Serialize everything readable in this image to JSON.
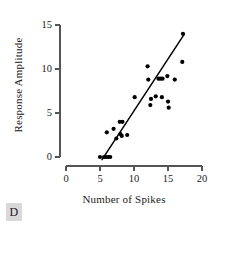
{
  "panel": {
    "letter": "D"
  },
  "chart_data": {
    "type": "scatter",
    "title": "",
    "xlabel": "Number of Spikes",
    "ylabel": "Response Amplitude",
    "xlim": [
      0,
      20
    ],
    "ylim": [
      0,
      15
    ],
    "xticks": [
      0,
      5,
      10,
      15,
      20
    ],
    "yticks": [
      0,
      5,
      10,
      15
    ],
    "xtick_labels": [
      "0",
      "5",
      "10",
      "15",
      "20"
    ],
    "ytick_labels": [
      "0",
      "5",
      "10",
      "15"
    ],
    "grid": false,
    "legend": null,
    "marker_color": "#000000",
    "marker_size": 4.2,
    "line_color": "#000000",
    "points": [
      [
        5.0,
        0.0
      ],
      [
        5.6,
        0.0
      ],
      [
        5.9,
        0.0
      ],
      [
        6.2,
        0.0
      ],
      [
        6.5,
        0.0
      ],
      [
        6.0,
        2.8
      ],
      [
        7.0,
        3.2
      ],
      [
        7.4,
        2.1
      ],
      [
        7.9,
        4.0
      ],
      [
        8.3,
        4.0
      ],
      [
        8.0,
        2.6
      ],
      [
        8.2,
        2.4
      ],
      [
        9.0,
        2.5
      ],
      [
        10.1,
        6.8
      ],
      [
        12.0,
        10.3
      ],
      [
        12.1,
        8.8
      ],
      [
        12.5,
        6.6
      ],
      [
        12.4,
        5.9
      ],
      [
        13.2,
        6.9
      ],
      [
        13.6,
        8.9
      ],
      [
        13.9,
        8.9
      ],
      [
        14.2,
        8.9
      ],
      [
        14.1,
        6.8
      ],
      [
        14.9,
        9.2
      ],
      [
        15.0,
        6.3
      ],
      [
        15.1,
        5.6
      ],
      [
        16.0,
        8.8
      ],
      [
        17.1,
        10.8
      ],
      [
        17.2,
        14.0
      ]
    ],
    "fit_line": {
      "type": "linear-regression",
      "x_start": 5.3,
      "y_start": -0.3,
      "x_end": 17.35,
      "y_end": 13.9
    }
  }
}
